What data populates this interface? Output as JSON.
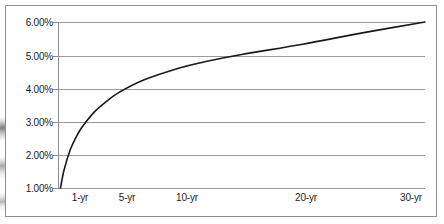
{
  "figure": {
    "background_color": "#ffffff",
    "frame_color": "#8d8d8d",
    "gridline_color": "#9a9a9a",
    "curve_color": "#1a1a1a"
  },
  "chart_data": {
    "type": "line",
    "title": "",
    "subtitle": "",
    "xlabel": "",
    "ylabel": "",
    "grid": true,
    "legend": "none",
    "xlim": [
      0,
      30
    ],
    "ylim": [
      1,
      6
    ],
    "x_tick_labels": [
      "1-yr",
      "5-yr",
      "10-yr",
      "20-yr",
      "30-yr"
    ],
    "x_tick_values": [
      1,
      5,
      10,
      20,
      30
    ],
    "y_tick_labels": [
      "1.00%",
      "2.00%",
      "3.00%",
      "4.00%",
      "5.00%",
      "6.00%"
    ],
    "y_tick_values": [
      1.0,
      2.0,
      3.0,
      4.0,
      5.0,
      6.0
    ],
    "series": [
      {
        "name": "Yield Curve",
        "x": [
          0.2,
          0.5,
          1.0,
          1.5,
          2.0,
          3.0,
          4.0,
          5.0,
          7.0,
          10.0,
          12.0,
          15.0,
          20.0,
          25.0,
          30.0
        ],
        "values": [
          1.0,
          1.55,
          2.15,
          2.55,
          2.85,
          3.3,
          3.62,
          3.88,
          4.25,
          4.62,
          4.8,
          5.02,
          5.33,
          5.68,
          6.0
        ]
      }
    ]
  }
}
